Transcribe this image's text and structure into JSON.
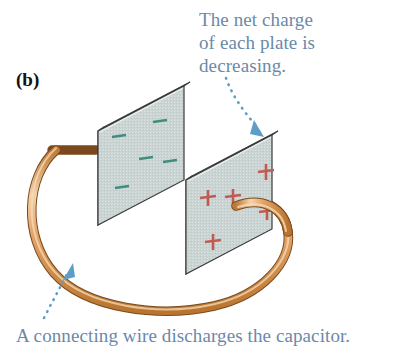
{
  "figure": {
    "panel_label": "(b)",
    "background_color": "#ffffff",
    "width": 394,
    "height": 359
  },
  "annotations": {
    "top_callout": {
      "name": "net-charge-callout",
      "lines": [
        "The net charge",
        "of each plate is",
        "decreasing."
      ],
      "text": "The net charge\nof each plate is\ndecreasing.",
      "color": "#6b89a8",
      "leader": "dotted-arrow-to-positive-plate"
    },
    "bottom_callout": {
      "name": "discharge-wire-callout",
      "text": "A connecting wire discharges the capacitor.",
      "color": "#6b89a8",
      "leader": "dotted-arrow-to-wire"
    }
  },
  "diagram": {
    "type": "capacitor-discharging",
    "plates": [
      {
        "id": "negative-plate",
        "position": "left",
        "charge_sign": "-",
        "charge_count": 5,
        "charge_color": "#3f8d7e",
        "face_color": "#c9d3d1",
        "edge_color": "#aab6b6",
        "outline_color": "#3a3a3a",
        "charges": [
          {
            "x": 119,
            "y": 136
          },
          {
            "x": 160,
            "y": 122
          },
          {
            "x": 146,
            "y": 158
          },
          {
            "x": 170,
            "y": 161
          },
          {
            "x": 122,
            "y": 187
          }
        ]
      },
      {
        "id": "positive-plate",
        "position": "right",
        "charge_sign": "+",
        "charge_count": 5,
        "charge_color": "#c05b53",
        "face_color": "#c9d3d1",
        "edge_color": "#aab6b6",
        "outline_color": "#3a3a3a",
        "charges": [
          {
            "x": 266,
            "y": 172
          },
          {
            "x": 208,
            "y": 198
          },
          {
            "x": 233,
            "y": 197
          },
          {
            "x": 267,
            "y": 212
          },
          {
            "x": 213,
            "y": 242
          }
        ]
      }
    ],
    "wire": {
      "id": "connecting-wire",
      "fill_color": "#e0a267",
      "highlight_color": "#f0cfa8",
      "outline_color": "#7a4a1e",
      "description": "A copper wire looping from the back of the negative plate, around below, up to the face of the positive plate"
    },
    "leaders": {
      "color": "#5d9ec9",
      "style": "dotted"
    }
  }
}
